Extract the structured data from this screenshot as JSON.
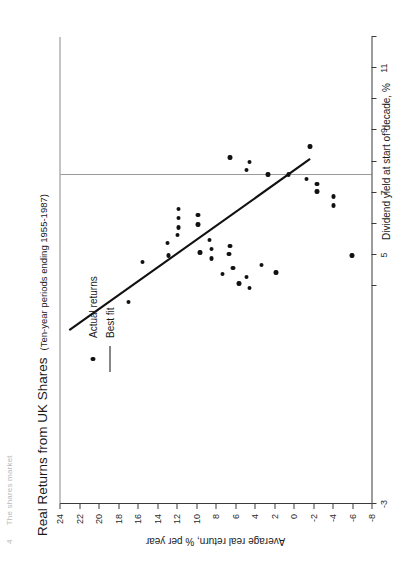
{
  "running_head": {
    "folio": "4",
    "text": "The shares market"
  },
  "chart_data": {
    "type": "scatter",
    "title": "Real Returns from UK Shares",
    "subtitle": "(Ten-year periods ending 1955-1987)",
    "xlabel": "Dividend yield at start of decade, %",
    "ylabel": "Average real return, % per year",
    "xlim": [
      -3,
      12
    ],
    "ylim": [
      -8,
      24
    ],
    "xticks": [
      -3,
      4,
      5,
      6,
      7,
      8,
      9,
      10,
      11,
      12
    ],
    "xtick_labels": [
      "-3",
      "",
      "5",
      "",
      "7",
      "",
      "9",
      "",
      "11",
      ""
    ],
    "yticks": [
      24,
      22,
      20,
      18,
      16,
      14,
      12,
      10,
      8,
      6,
      4,
      2,
      0,
      -2,
      -4,
      -6,
      -8
    ],
    "ytick_labels": [
      "24",
      "22",
      "20",
      "18",
      "16",
      "14",
      "12",
      "10",
      "8",
      "6",
      "4",
      "2",
      "0",
      "-2",
      "-4",
      "-6",
      "-8"
    ],
    "grid": false,
    "zero_reference_x": 7.55,
    "legend_position": "upper-right",
    "legend": [
      {
        "label": "Actual returns",
        "marker": "dot"
      },
      {
        "label": "Best fit",
        "marker": "line"
      }
    ],
    "series": [
      {
        "name": "Actual returns",
        "marker": "dot",
        "color": "#111111",
        "points": [
          {
            "x": 3.45,
            "y": 17.0
          },
          {
            "x": 4.75,
            "y": 15.6
          },
          {
            "x": 5.35,
            "y": 13.0
          },
          {
            "x": 4.95,
            "y": 12.9
          },
          {
            "x": 5.6,
            "y": 12.0
          },
          {
            "x": 5.85,
            "y": 11.9
          },
          {
            "x": 6.15,
            "y": 11.9
          },
          {
            "x": 6.45,
            "y": 11.9
          },
          {
            "x": 5.95,
            "y": 9.9
          },
          {
            "x": 6.25,
            "y": 9.9
          },
          {
            "x": 5.05,
            "y": 9.7
          },
          {
            "x": 5.45,
            "y": 8.7
          },
          {
            "x": 5.15,
            "y": 8.5
          },
          {
            "x": 4.85,
            "y": 8.5
          },
          {
            "x": 4.35,
            "y": 7.4
          },
          {
            "x": 5.0,
            "y": 6.7
          },
          {
            "x": 5.25,
            "y": 6.6
          },
          {
            "x": 4.55,
            "y": 6.3
          },
          {
            "x": 4.05,
            "y": 5.7
          },
          {
            "x": 4.25,
            "y": 4.9
          },
          {
            "x": 3.9,
            "y": 4.6
          },
          {
            "x": 4.65,
            "y": 3.4
          },
          {
            "x": 4.4,
            "y": 1.9
          },
          {
            "x": 8.1,
            "y": 6.6
          },
          {
            "x": 7.7,
            "y": 4.9
          },
          {
            "x": 7.95,
            "y": 4.6
          },
          {
            "x": 7.55,
            "y": 2.7
          },
          {
            "x": 7.55,
            "y": 0.6
          },
          {
            "x": 7.4,
            "y": -1.2
          },
          {
            "x": 8.45,
            "y": -1.6
          },
          {
            "x": 7.0,
            "y": -2.3
          },
          {
            "x": 7.25,
            "y": -2.3
          },
          {
            "x": 6.85,
            "y": -4.0
          },
          {
            "x": 6.55,
            "y": -4.0
          },
          {
            "x": 4.95,
            "y": -5.9
          }
        ]
      }
    ],
    "best_fit": {
      "name": "Best fit",
      "color": "#111111",
      "x0": 2.55,
      "y0": 23.1,
      "x1": 8.05,
      "y1": -1.6
    }
  }
}
